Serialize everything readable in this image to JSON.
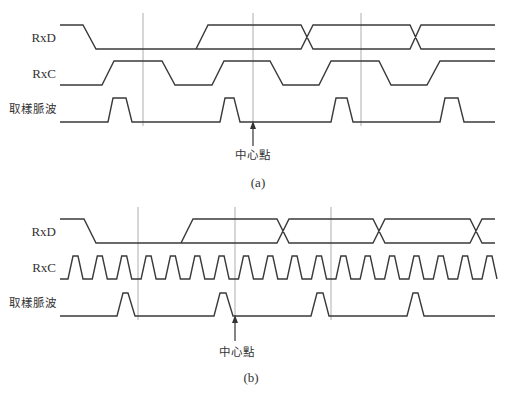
{
  "colors": {
    "waveform": "#3a3a3a",
    "guide_line": "#9a9a9a",
    "text": "#333333",
    "background": "#ffffff"
  },
  "diagram_a": {
    "caption": "(a)",
    "labels": {
      "rxd": "RxD",
      "rxc": "RxC",
      "sample_pulse": "取樣脈波",
      "center_point": "中心點"
    },
    "rxd_path": "M60,25 L83,25 L96,49 L196,49 L208,25 L301,25 L313,49 L410,49 L421,25 L495,25 M196,49 L301,49 L313,25 L410,25 L421,49 L495,49",
    "rxc_path": "M60,85 L102,85 L114,61 L162,61 L175,85 L212,85 L224,61 L270,61 L283,85 L319,85 L331,61 L379,61 L391,85 L427,85 L440,61 L495,61",
    "pulse_path": "M60,122 L108,122 L113,98 L126,98 L132,122 L220,122 L225,98 L234,98 L240,122 L331,122 L336,98 L347,98 L353,122 L440,122 L445,98 L458,98 L464,122 L495,122",
    "guides_x": [
      143,
      253,
      361
    ],
    "arrow_x": 253
  },
  "diagram_b": {
    "caption": "(b)",
    "labels": {
      "rxd": "RxD",
      "rxc": "RxC",
      "sample_pulse": "取樣脈波",
      "center_point": "中心點"
    },
    "rxd_path": "M60,219 L84,219 L96,243 L181,243 L193,219 L277,219 L289,243 L373,243 L385,219 L470,219 L482,243 L495,243 M181,243 L277,243 L289,219 L373,219 L385,243 L470,243 L482,219 L495,219",
    "pulse_path": "M60,316 L117,316 L123,293 L128,293 L135,316 L214,316 L220,293 L226,293 L233,316 L311,316 L317,293 L323,293 L329,316 L407,316 L413,293 L418,293 L424,316 L495,316",
    "rxc": {
      "x_start": 60,
      "first_rise": 68,
      "period": 24.35,
      "rise": 5,
      "high": 5,
      "fall": 5,
      "count": 18,
      "y_high": 256,
      "y_low": 279,
      "x_end": 495
    },
    "guides_x": [
      138,
      235,
      331
    ],
    "arrow_x": 235
  }
}
